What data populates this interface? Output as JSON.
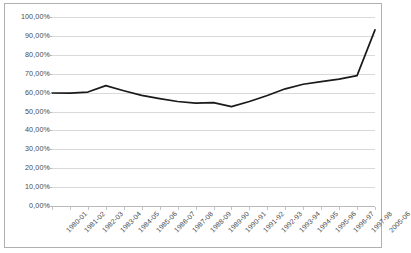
{
  "chart_data": {
    "type": "line",
    "title": "",
    "xlabel": "",
    "ylabel": "",
    "ylim": [
      0,
      100
    ],
    "yunit": "%",
    "grid": true,
    "legend": "none",
    "y_ticks": [
      "0,00%",
      "10,00%",
      "20,00%",
      "30,00%",
      "40,00%",
      "50,00%",
      "60,00%",
      "70,00%",
      "80,00%",
      "90,00%",
      "100,00%"
    ],
    "y_tick_values": [
      0,
      10,
      20,
      30,
      40,
      50,
      60,
      70,
      80,
      90,
      100
    ],
    "categories": [
      "1980-01",
      "1981-02",
      "1982-03",
      "1983-04",
      "1984-05",
      "1985-06",
      "1986-07",
      "1987-08",
      "1988-09",
      "1989-90",
      "1990-91",
      "1991-92",
      "1992-93",
      "1993-94",
      "1994-95",
      "1995-96",
      "1996-97",
      "1997-98",
      "2005-06"
    ],
    "values": [
      59.8,
      59.7,
      60.3,
      63.7,
      61.0,
      58.5,
      56.8,
      55.3,
      54.4,
      54.7,
      52.6,
      55.3,
      58.5,
      62.0,
      64.4,
      65.8,
      67.1,
      69.0,
      93.2
    ],
    "series": [
      {
        "name": "series-1",
        "color": "#1a1a1a",
        "values": [
          59.8,
          59.7,
          60.3,
          63.7,
          61.0,
          58.5,
          56.8,
          55.3,
          54.4,
          54.7,
          52.6,
          55.3,
          58.5,
          62.0,
          64.4,
          65.8,
          67.1,
          69.0,
          93.2
        ]
      }
    ]
  },
  "style": {
    "line_color": "#1a1a1a",
    "grid_color": "#d9d9d9",
    "axis_color": "#b9b9b9",
    "frame_color": "#b0b0b0",
    "plot_background": "#ffffff",
    "label_color": "#4a4a4a"
  }
}
